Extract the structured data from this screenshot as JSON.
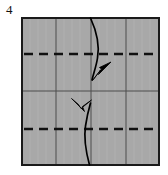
{
  "figure": {
    "step_label": "4",
    "kind": "origami-fold-diagram",
    "canvas": {
      "width": 168,
      "height": 175,
      "background": "#ffffff"
    }
  },
  "paper": {
    "name": "folded-paper-square",
    "x": 21,
    "y": 17,
    "width": 139,
    "height": 149,
    "fill": "#a8a8a8",
    "stroke": "#1a1a1a",
    "stroke_width": 2
  },
  "crease_lines": {
    "vertical_solid": {
      "count": 3,
      "x_positions": [
        56,
        91,
        126
      ],
      "stroke": "#4d4d4d",
      "stroke_width": 1,
      "label": "existing vertical creases (quarters)"
    },
    "horizontal_solid": {
      "count": 1,
      "y_positions": [
        91
      ],
      "stroke": "#4d4d4d",
      "stroke_width": 1,
      "label": "existing horizontal crease (center)"
    },
    "horizontal_dashed": {
      "count": 2,
      "y_positions": [
        54,
        129
      ],
      "stroke": "#111111",
      "stroke_width": 2.4,
      "dash": "9 6",
      "label": "valley fold lines (top quarter and bottom quarter)"
    }
  },
  "arrows": [
    {
      "name": "fold-arrow-upper",
      "direction": "up-right",
      "description": "top edge folds down to center, arrow curves from top edge to just below the upper dashed crease",
      "start": {
        "x": 91,
        "y": 18
      },
      "end": {
        "x": 110,
        "y": 63
      },
      "color": "#000000"
    },
    {
      "name": "fold-arrow-lower",
      "direction": "up-left",
      "description": "bottom edge folds up to center, arrow curves from bottom edge up to just above the lower dashed crease",
      "start": {
        "x": 89,
        "y": 165
      },
      "end": {
        "x": 72,
        "y": 98
      },
      "color": "#000000"
    }
  ],
  "colors": {
    "paper_gray": "#a8a8a8",
    "ink": "#111111",
    "crease_gray": "#4d4d4d",
    "page_white": "#ffffff"
  }
}
